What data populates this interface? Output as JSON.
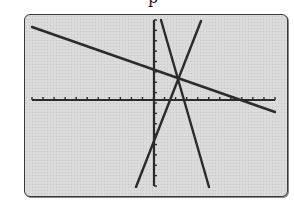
{
  "caption_fragment": "p",
  "screen": {
    "description": "Graphing calculator screen showing three lines intersecting at a single point",
    "background": "#d9d9d9",
    "border": "#3a3a3a",
    "line_color": "#2b2b2b"
  },
  "axes": {
    "x_axis": {
      "y": 100,
      "x_start": 32,
      "x_end": 275,
      "tick_count": 22
    },
    "y_axis": {
      "x": 154,
      "y_start": 20,
      "y_end": 186,
      "tick_count": 16
    }
  },
  "lines": [
    {
      "name": "shallow-decreasing-line",
      "x1": 32,
      "y1": 27,
      "x2": 275,
      "y2": 112
    },
    {
      "name": "steep-decreasing-line",
      "x1": 161,
      "y1": 20,
      "x2": 209,
      "y2": 187
    },
    {
      "name": "steep-increasing-line",
      "x1": 201,
      "y1": 21,
      "x2": 136,
      "y2": 187
    }
  ],
  "intersection_point": {
    "x": 178,
    "y": 78
  }
}
